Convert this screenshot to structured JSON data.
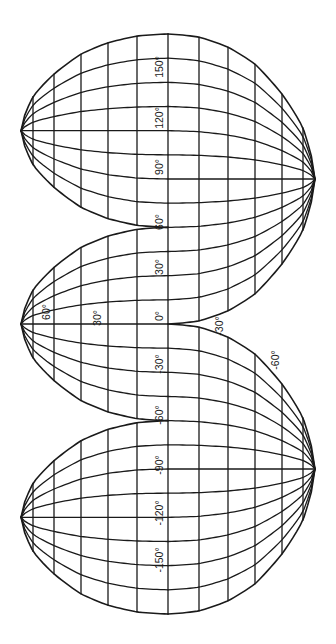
{
  "colors": {
    "line": "#1a1a1a",
    "background": "#ffffff"
  },
  "projection": {
    "orientation": "rotated 90 degrees; north pole at left, south pole at right",
    "equator_x": 168,
    "pole_offset_px": 147,
    "lon0_y": 324,
    "px_per_degree_lon": 1.611,
    "parallels": [
      {
        "lat": 15,
        "dx": 31,
        "ratio": 0.98
      },
      {
        "lat": 30,
        "dx": 60,
        "ratio": 0.906
      },
      {
        "lat": 45,
        "dx": 87,
        "ratio": 0.78
      },
      {
        "lat": 60,
        "dx": 114,
        "ratio": 0.54
      },
      {
        "lat": 75,
        "dx": 135,
        "ratio": 0.31
      },
      {
        "lat": 90,
        "dx": 147,
        "ratio": 0.0
      }
    ],
    "meridian_step_deg": 15,
    "north_lobes": [
      {
        "center_lon": 120,
        "west_lon": 60,
        "east_lon": 180
      },
      {
        "center_lon": 0,
        "west_lon": -60,
        "east_lon": 60
      },
      {
        "center_lon": -120,
        "west_lon": -180,
        "east_lon": -60
      }
    ],
    "south_lobes": [
      {
        "center_lon": 90,
        "west_lon": 0,
        "east_lon": 180
      },
      {
        "center_lon": -90,
        "west_lon": -180,
        "east_lon": 0
      }
    ]
  },
  "labels": {
    "longitude": [
      {
        "text": "150°",
        "x": 163,
        "y": 67
      },
      {
        "text": "120°",
        "x": 163,
        "y": 118
      },
      {
        "text": "90°",
        "x": 163,
        "y": 167
      },
      {
        "text": "60°",
        "x": 163,
        "y": 222
      },
      {
        "text": "30°",
        "x": 163,
        "y": 267
      },
      {
        "text": "0°",
        "x": 163,
        "y": 316
      },
      {
        "text": "-30°",
        "x": 163,
        "y": 364
      },
      {
        "text": "-60°",
        "x": 163,
        "y": 415
      },
      {
        "text": "-90°",
        "x": 163,
        "y": 465
      },
      {
        "text": "-120°",
        "x": 163,
        "y": 513
      },
      {
        "text": "-150°",
        "x": 163,
        "y": 560
      }
    ],
    "latitude": [
      {
        "text": "60°",
        "x": 50,
        "y": 312
      },
      {
        "text": "30°",
        "x": 101,
        "y": 318
      },
      {
        "text": "-30°",
        "x": 223,
        "y": 326
      },
      {
        "text": "-60°",
        "x": 279,
        "y": 360
      }
    ]
  }
}
